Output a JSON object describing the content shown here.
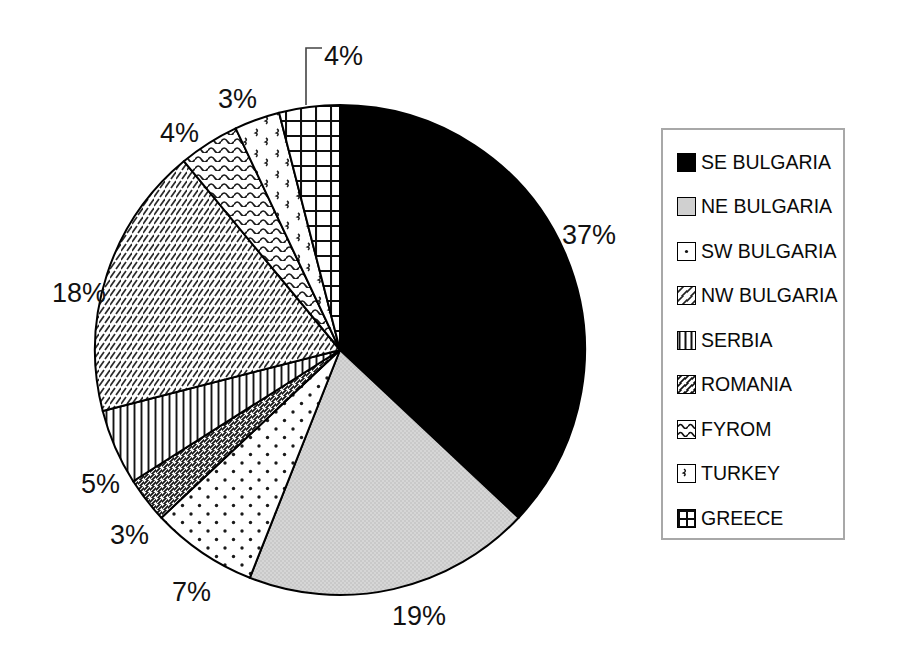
{
  "chart_data": {
    "type": "pie",
    "title": "",
    "subtitle": "",
    "xlabel": "",
    "ylabel": "",
    "grid": false,
    "legend_position": "right",
    "units": "percent",
    "start_angle_deg": 0,
    "direction": "clockwise",
    "categories": [
      "SE BULGARIA",
      "NE BULGARIA",
      "SW BULGARIA",
      "ROMANIA",
      "SERBIA",
      "NW BULGARIA",
      "FYROM",
      "TURKEY",
      "GREECE"
    ],
    "values": [
      37,
      19,
      7,
      3,
      5,
      18,
      4,
      3,
      4
    ],
    "data_labels": [
      "37%",
      "19%",
      "7%",
      "3%",
      "5%",
      "18%",
      "4%",
      "3%",
      "4%"
    ],
    "slices": [
      {
        "label": "SE BULGARIA",
        "value": 37,
        "data_label": "37%",
        "fill": "solid-black",
        "color": "#000000",
        "label_x": 562,
        "label_y": 220,
        "leader": false
      },
      {
        "label": "NE BULGARIA",
        "value": 19,
        "data_label": "19%",
        "fill": "light-gray",
        "color": "#d4d4d4",
        "label_x": 392,
        "label_y": 601,
        "leader": false
      },
      {
        "label": "SW BULGARIA",
        "value": 7,
        "data_label": "7%",
        "fill": "sparse-dots",
        "color": "#ffffff",
        "label_x": 172,
        "label_y": 577,
        "leader": false
      },
      {
        "label": "ROMANIA",
        "value": 3,
        "data_label": "3%",
        "fill": "dense-diagonal-hatch",
        "color": "#ffffff",
        "label_x": 110,
        "label_y": 520,
        "leader": false
      },
      {
        "label": "SERBIA",
        "value": 5,
        "data_label": "5%",
        "fill": "vertical-lines",
        "color": "#ffffff",
        "label_x": 81,
        "label_y": 469,
        "leader": false
      },
      {
        "label": "NW BULGARIA",
        "value": 18,
        "data_label": "18%",
        "fill": "fine-diagonal-hatch",
        "color": "#ffffff",
        "label_x": 52,
        "label_y": 278,
        "leader": false
      },
      {
        "label": "FYROM",
        "value": 4,
        "data_label": "4%",
        "fill": "wavy-lines",
        "color": "#ffffff",
        "label_x": 160,
        "label_y": 118,
        "leader": false
      },
      {
        "label": "TURKEY",
        "value": 3,
        "data_label": "3%",
        "fill": "scattered-marks",
        "color": "#ffffff",
        "label_x": 218,
        "label_y": 84,
        "leader": false
      },
      {
        "label": "GREECE",
        "value": 4,
        "data_label": "4%",
        "fill": "grid-crosshatch",
        "color": "#ffffff",
        "label_x": 324,
        "label_y": 41,
        "leader": true
      }
    ],
    "geometry": {
      "center_x": 340,
      "center_y": 350,
      "radius": 245
    },
    "leader_line": {
      "from_x": 306,
      "from_y": 105,
      "elbow_x": 306,
      "elbow_y": 48,
      "to_x": 322,
      "to_y": 48
    }
  },
  "legend": {
    "items": [
      {
        "label": "SE BULGARIA",
        "pattern": "solid-black"
      },
      {
        "label": "NE BULGARIA",
        "pattern": "light-gray"
      },
      {
        "label": "SW BULGARIA",
        "pattern": "sparse-dots"
      },
      {
        "label": "NW BULGARIA",
        "pattern": "fine-diagonal-hatch"
      },
      {
        "label": "SERBIA",
        "pattern": "vertical-lines"
      },
      {
        "label": "ROMANIA",
        "pattern": "dense-diagonal-hatch"
      },
      {
        "label": "FYROM",
        "pattern": "wavy-lines"
      },
      {
        "label": "TURKEY",
        "pattern": "scattered-marks"
      },
      {
        "label": "GREECE",
        "pattern": "grid-crosshatch"
      }
    ]
  }
}
